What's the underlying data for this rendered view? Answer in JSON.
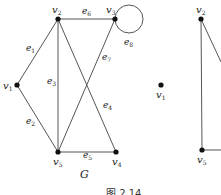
{
  "figure": {
    "caption": "图   2.14",
    "graph_label": "G"
  },
  "graph_G": {
    "vertices": [
      {
        "id": "v1",
        "name": "v",
        "sub": "1",
        "x": 17,
        "y": 85
      },
      {
        "id": "v2",
        "name": "v",
        "sub": "2",
        "x": 58,
        "y": 19
      },
      {
        "id": "v3",
        "name": "v",
        "sub": "3",
        "x": 115,
        "y": 19
      },
      {
        "id": "v4",
        "name": "v",
        "sub": "4",
        "x": 116,
        "y": 152
      },
      {
        "id": "v5",
        "name": "v",
        "sub": "5",
        "x": 58,
        "y": 152
      }
    ],
    "edges": [
      {
        "id": "e1",
        "name": "e",
        "sub": "1",
        "from": "v1",
        "to": "v2"
      },
      {
        "id": "e2",
        "name": "e",
        "sub": "2",
        "from": "v1",
        "to": "v5"
      },
      {
        "id": "e3",
        "name": "e",
        "sub": "3",
        "from": "v2",
        "to": "v5"
      },
      {
        "id": "e4",
        "name": "e",
        "sub": "4",
        "from": "v2",
        "to": "v4"
      },
      {
        "id": "e5",
        "name": "e",
        "sub": "5",
        "from": "v5",
        "to": "v4"
      },
      {
        "id": "e6",
        "name": "e",
        "sub": "6",
        "from": "v2",
        "to": "v3"
      },
      {
        "id": "e7",
        "name": "e",
        "sub": "7",
        "from": "v3",
        "to": "v5"
      },
      {
        "id": "e8",
        "name": "e",
        "sub": "8",
        "from": "v3",
        "to": "v3",
        "loop": true
      }
    ]
  },
  "graph_partial": {
    "vertices": [
      {
        "id": "v1",
        "name": "v",
        "sub": "1",
        "x": 161,
        "y": 85
      },
      {
        "id": "v2",
        "name": "v",
        "sub": "2",
        "x": 201,
        "y": 19
      },
      {
        "id": "v5",
        "name": "v",
        "sub": "5",
        "x": 202,
        "y": 150
      }
    ],
    "edges": [
      {
        "from": "v2",
        "to": "v5"
      },
      {
        "from": "v2",
        "to": "offscreen-right"
      },
      {
        "from": "v5",
        "to": "offscreen-right"
      }
    ]
  },
  "colors": {
    "edge": "#555555",
    "vertex": "#111111",
    "text": "#222222"
  }
}
